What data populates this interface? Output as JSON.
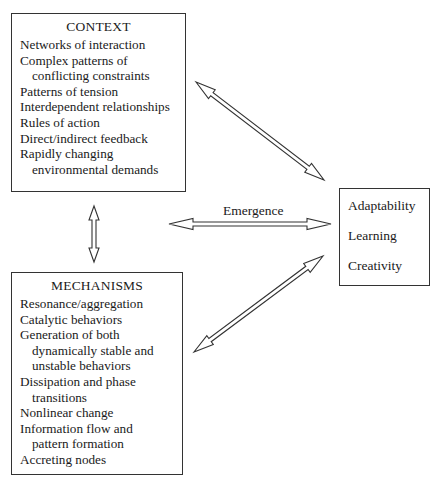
{
  "context": {
    "title": "CONTEXT",
    "items": [
      {
        "line1": "Networks of interaction"
      },
      {
        "line1": "Complex patterns of",
        "line2": "conflicting constraints"
      },
      {
        "line1": "Patterns of tension"
      },
      {
        "line1": "Interdependent relationships"
      },
      {
        "line1": "Rules of action"
      },
      {
        "line1": "Direct/indirect feedback"
      },
      {
        "line1": "Rapidly changing",
        "line2": "environmental demands"
      }
    ]
  },
  "mechanisms": {
    "title": "MECHANISMS",
    "items": [
      {
        "line1": "Resonance/aggregation"
      },
      {
        "line1": "Catalytic behaviors"
      },
      {
        "line1": "Generation of both",
        "line2": "dynamically stable and",
        "line3": "unstable behaviors"
      },
      {
        "line1": "Dissipation and phase",
        "line2": "transitions"
      },
      {
        "line1": "Nonlinear change"
      },
      {
        "line1": "Information flow and",
        "line2": "pattern formation"
      },
      {
        "line1": "Accreting nodes"
      }
    ]
  },
  "outcomes": {
    "items": [
      "Adaptability",
      "Learning",
      "Creativity"
    ]
  },
  "connectors": {
    "emergence_label": "Emergence",
    "arrow_style": "double-headed hollow"
  }
}
